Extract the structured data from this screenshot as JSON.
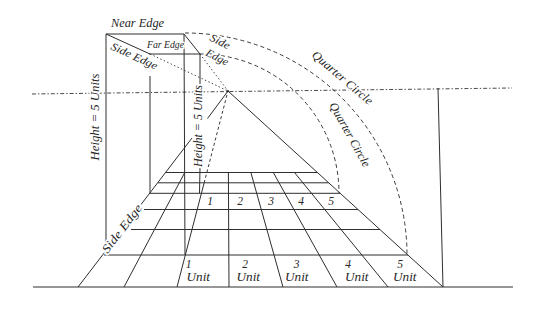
{
  "diagram": {
    "labels": {
      "near_edge": "Near Edge",
      "far_edge": "Far Edge",
      "side_edge_top_left": "Side Edge",
      "side_edge_top_right": [
        "Side",
        "Edge"
      ],
      "side_edge_floor": "Side Edge",
      "quarter_circle_outer": "Quarter Circle",
      "quarter_circle_inner": "Quarter Circle",
      "height_near": "Height = 5 Units",
      "height_far": "Height = 5 Units"
    },
    "floor_grid": {
      "far_row_numbers": [
        "1",
        "2",
        "3",
        "4",
        "5"
      ],
      "near_row": [
        {
          "number": "1",
          "unit": "Unit"
        },
        {
          "number": "2",
          "unit": "Unit"
        },
        {
          "number": "3",
          "unit": "Unit"
        },
        {
          "number": "4",
          "unit": "Unit"
        },
        {
          "number": "5",
          "unit": "Unit"
        }
      ]
    }
  }
}
